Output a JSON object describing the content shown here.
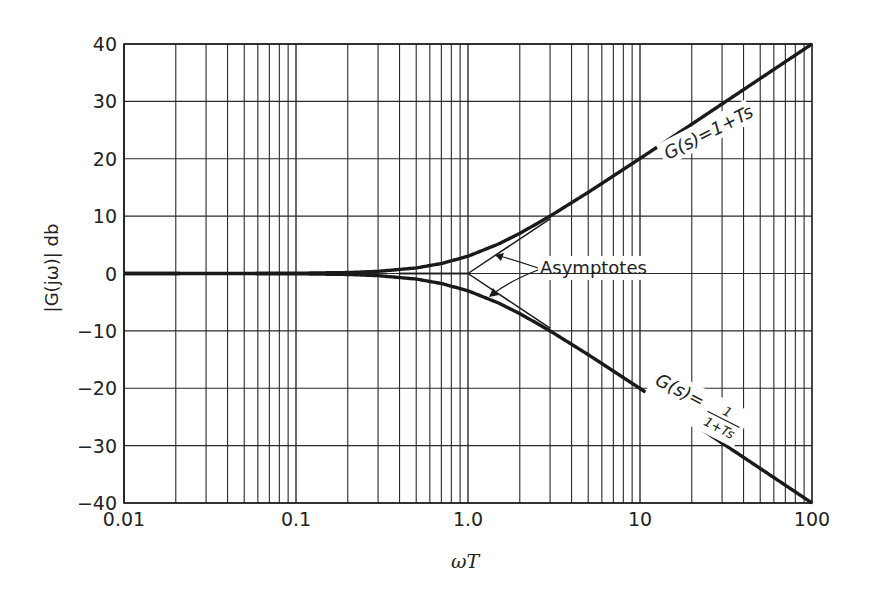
{
  "chart_data": {
    "type": "line",
    "title": "",
    "xlabel": "ωT",
    "ylabel": "|G(jω)|  db",
    "xscale": "log",
    "xlim": [
      0.01,
      100
    ],
    "ylim": [
      -40,
      40
    ],
    "grid": true,
    "x_ticks": [
      {
        "value": 0.01,
        "label": "0.01"
      },
      {
        "value": 0.1,
        "label": "0.1"
      },
      {
        "value": 1,
        "label": "1.0"
      },
      {
        "value": 10,
        "label": "10"
      },
      {
        "value": 100,
        "label": "100"
      }
    ],
    "y_ticks": [
      {
        "value": 40,
        "label": "40"
      },
      {
        "value": 30,
        "label": "30"
      },
      {
        "value": 20,
        "label": "20"
      },
      {
        "value": 10,
        "label": "10"
      },
      {
        "value": 0,
        "label": "0"
      },
      {
        "value": -10,
        "label": "-10"
      },
      {
        "value": -20,
        "label": "-20"
      },
      {
        "value": -30,
        "label": "-30"
      },
      {
        "value": -40,
        "label": "-40"
      }
    ],
    "x": [
      0.01,
      0.1,
      0.2,
      0.3,
      0.5,
      0.7,
      1.0,
      1.5,
      2,
      3,
      5,
      10,
      20,
      50,
      100
    ],
    "series": [
      {
        "name": "G(s)=1+Ts",
        "style": "thick",
        "values": [
          0.0,
          0.04,
          0.17,
          0.37,
          0.97,
          1.74,
          3.01,
          5.12,
          6.99,
          10.0,
          14.15,
          20.04,
          26.03,
          33.98,
          40.0
        ]
      },
      {
        "name": "G(s)=1/(1+Ts)",
        "style": "thick",
        "values": [
          0.0,
          -0.04,
          -0.17,
          -0.37,
          -0.97,
          -1.74,
          -3.01,
          -5.12,
          -6.99,
          -10.0,
          -14.15,
          -20.04,
          -26.03,
          -33.98,
          -40.0
        ]
      },
      {
        "name": "Asymptote (1+Ts)",
        "style": "thin",
        "values": [
          0,
          0,
          0,
          0,
          0,
          0,
          0,
          3.52,
          6.02,
          9.54,
          13.98,
          20,
          26.02,
          33.98,
          40
        ]
      },
      {
        "name": "Asymptote 1/(1+Ts)",
        "style": "thin",
        "values": [
          0,
          0,
          0,
          0,
          0,
          0,
          0,
          -3.52,
          -6.02,
          -9.54,
          -13.98,
          -20,
          -26.02,
          -33.98,
          -40
        ]
      }
    ],
    "annotations": [
      {
        "text": "G(s)=1+Ts",
        "near_x": 20,
        "near_y": 22
      },
      {
        "text": "G(s)=",
        "numerator": "1",
        "denominator": "1+Ts",
        "near_x": 20,
        "near_y": -22
      },
      {
        "text": "Asymptotes",
        "near_x": 3,
        "near_y": 1,
        "arrows_to": [
          "upper asymptote at ωT≈1.5",
          "lower asymptote at ωT≈1.5"
        ]
      }
    ],
    "legend": "none"
  },
  "labels": {
    "xlabel": "ωT",
    "ylabel": "|G(jω)|  db",
    "upper_curve": "G(s)=1+Ts",
    "lower_prefix": "G(s)=",
    "lower_num": "1",
    "lower_den": "1+Ts",
    "asymptotes": "Asymptotes"
  },
  "colors": {
    "line": "#1a1a1a",
    "grid": "#2a2a2a",
    "background": "#ffffff"
  }
}
